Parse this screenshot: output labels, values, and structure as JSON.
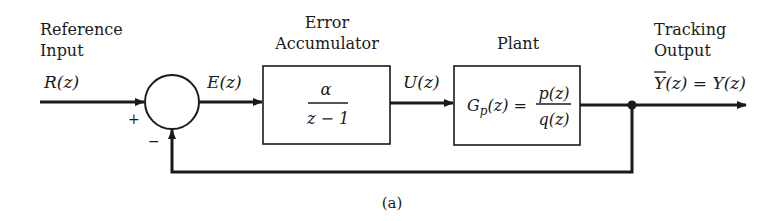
{
  "diagram": {
    "type": "block-diagram",
    "caption": "(a)",
    "input": {
      "title_line1": "Reference",
      "title_line2": "Input",
      "signal": "R(z)"
    },
    "summing_junction": {
      "plus_sign": "+",
      "minus_sign": "−"
    },
    "error_signal": "E(z)",
    "error_accumulator": {
      "title_line1": "Error",
      "title_line2": "Accumulator",
      "numerator": "α",
      "denominator": "z − 1"
    },
    "control_signal": "U(z)",
    "plant": {
      "title": "Plant",
      "lhs": "G",
      "lhs_sub": "p",
      "lhs_arg": "(z) =",
      "numerator": "p(z)",
      "denominator": "q(z)"
    },
    "output": {
      "title_line1": "Tracking",
      "title_line2": "Output",
      "ybar": "Y",
      "signal_rest": "(z) = Y(z)"
    }
  }
}
